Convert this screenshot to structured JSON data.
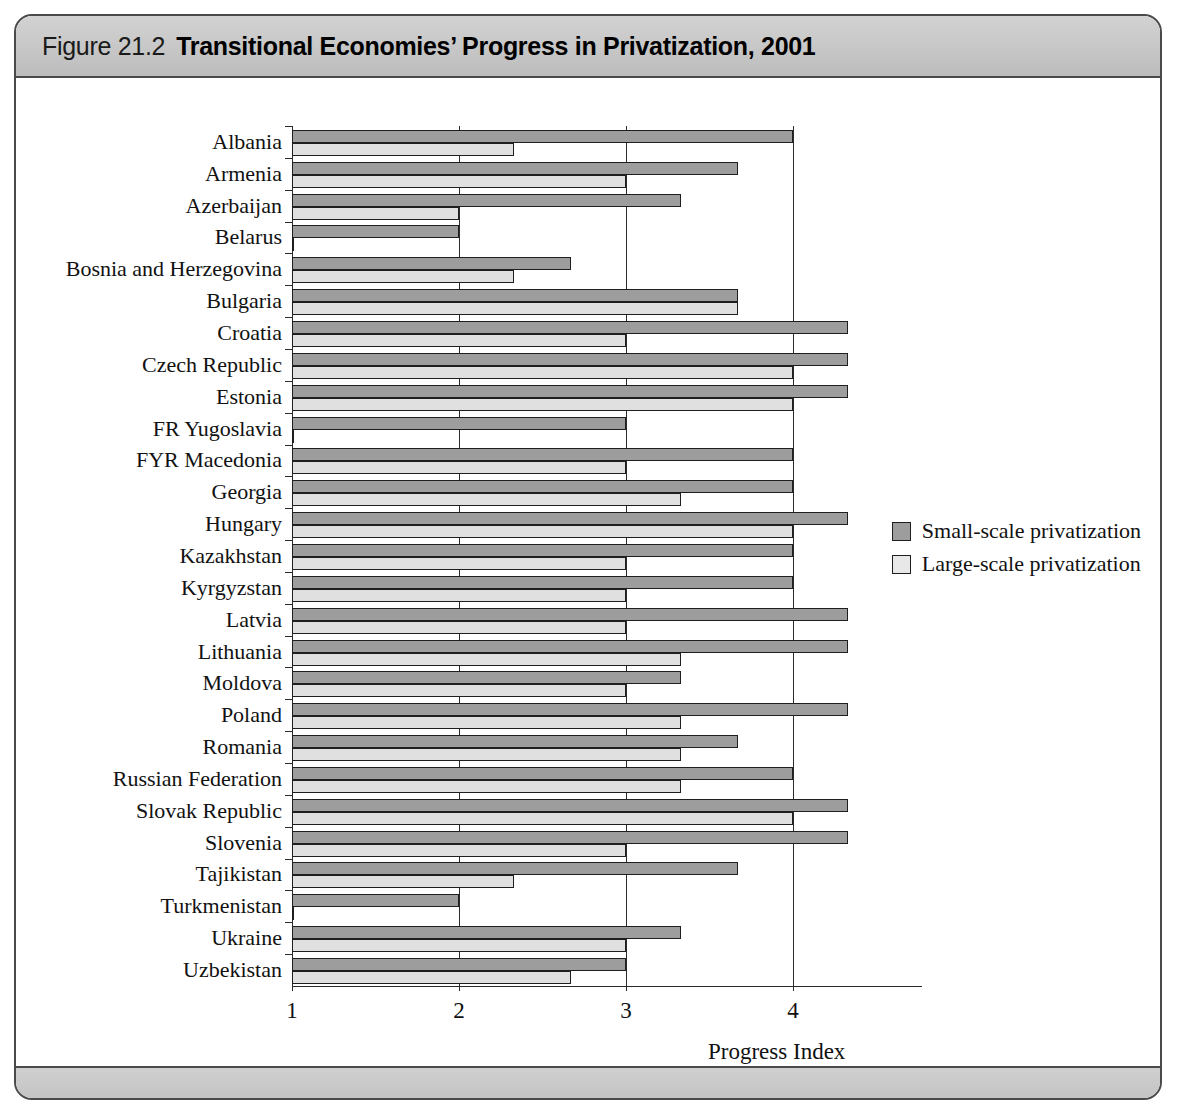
{
  "figure": {
    "number": "Figure 21.2",
    "title": "Transitional Economies’ Progress in Privatization, 2001"
  },
  "legend": {
    "position": "right-middle",
    "items": [
      {
        "label": "Small-scale privatization",
        "color": "#9d9d9d",
        "swatch": "filled-dark-square"
      },
      {
        "label": "Large-scale privatization",
        "color": "#e8e8e8",
        "swatch": "filled-light-square"
      }
    ]
  },
  "chart_data": {
    "type": "bar",
    "orientation": "horizontal",
    "title": "Transitional Economies’ Progress in Privatization, 2001",
    "xlabel": "Progress Index",
    "ylabel": "",
    "xlim": [
      1,
      4.4
    ],
    "xticks": [
      1,
      2,
      3,
      4
    ],
    "xtick_labels": [
      "1",
      "2",
      "3",
      "4"
    ],
    "grid": "vertical-at-xticks",
    "categories": [
      "Albania",
      "Armenia",
      "Azerbaijan",
      "Belarus",
      "Bosnia and Herzegovina",
      "Bulgaria",
      "Croatia",
      "Czech Republic",
      "Estonia",
      "FR Yugoslavia",
      "FYR Macedonia",
      "Georgia",
      "Hungary",
      "Kazakhstan",
      "Kyrgyzstan",
      "Latvia",
      "Lithuania",
      "Moldova",
      "Poland",
      "Romania",
      "Russian Federation",
      "Slovak Republic",
      "Slovenia",
      "Tajikistan",
      "Turkmenistan",
      "Ukraine",
      "Uzbekistan"
    ],
    "series": [
      {
        "name": "Small-scale privatization",
        "color": "#9d9d9d",
        "values": [
          4.0,
          3.67,
          3.33,
          2.0,
          2.67,
          3.67,
          4.33,
          4.33,
          4.33,
          3.0,
          4.0,
          4.0,
          4.33,
          4.0,
          4.0,
          4.33,
          4.33,
          3.33,
          4.33,
          3.67,
          4.0,
          4.33,
          4.33,
          3.67,
          2.0,
          3.33,
          3.0
        ]
      },
      {
        "name": "Large-scale privatization",
        "color": "#e0e0e0",
        "values": [
          2.33,
          3.0,
          2.0,
          1.0,
          2.33,
          3.67,
          3.0,
          4.0,
          4.0,
          1.0,
          3.0,
          3.33,
          4.0,
          3.0,
          3.0,
          3.0,
          3.33,
          3.0,
          3.33,
          3.33,
          3.33,
          4.0,
          3.0,
          2.33,
          1.0,
          3.0,
          2.67
        ]
      }
    ]
  }
}
